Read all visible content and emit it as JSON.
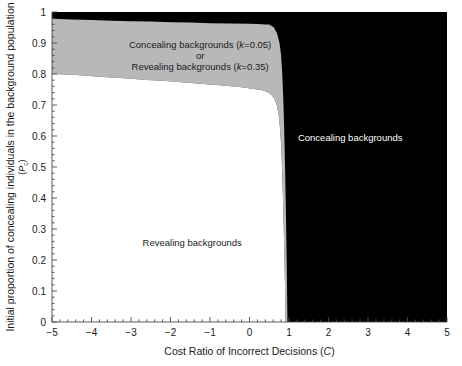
{
  "chart_data": {
    "type": "area",
    "title": "",
    "xlabel": "Cost Ratio of Incorrect Decisions (C)",
    "xlabel_main": "Cost Ratio of Incorrect Decisions (",
    "xlabel_var": "C",
    "xlabel_end": ")",
    "ylabel": "Initial proportion of concealing individuals in the background population",
    "ylabel_sub_open": "(",
    "ylabel_sub_var": "P",
    "ylabel_sub_idx": "c",
    "ylabel_sub_close": ")",
    "xlim": [
      -5,
      5
    ],
    "ylim": [
      0,
      1
    ],
    "xticks": [
      -5,
      -4,
      -3,
      -2,
      -1,
      0,
      1,
      2,
      3,
      4,
      5
    ],
    "xtick_labels": [
      "−5",
      "−4",
      "−3",
      "−2",
      "−1",
      "0",
      "1",
      "2",
      "3",
      "4",
      "5"
    ],
    "yticks": [
      0,
      0.1,
      0.2,
      0.3,
      0.4,
      0.5,
      0.6,
      0.7,
      0.8,
      0.9,
      1
    ],
    "ytick_labels": [
      "0",
      "0.1",
      "0.2",
      "0.3",
      "0.4",
      "0.5",
      "0.6",
      "0.7",
      "0.8",
      "0.9",
      "1"
    ],
    "minor_ticks_per_interval": 5,
    "grid": false,
    "legend_position": "none",
    "colors": {
      "region_concealing": "#000000",
      "region_mixed": "#b8b8b8",
      "region_revealing": "#ffffff",
      "axis": "#4a4a4a",
      "text_dark": "#1a1a1a",
      "text_light": "#ffffff"
    },
    "regions": [
      {
        "name": "concealing-backgrounds",
        "fill": "#000000",
        "label": "Concealing backgrounds",
        "label_x": 2.55,
        "label_y": 0.585,
        "label_color": "light"
      },
      {
        "name": "mixed-outcome",
        "fill": "#b8b8b8",
        "label_line1_main": "Concealing backgrounds (",
        "label_line1_var": "k",
        "label_line1_val": "=0.05)",
        "label_line2": "or",
        "label_line3_main": "Revealing backgrounds (",
        "label_line3_var": "k",
        "label_line3_val": "=0.35)",
        "label_x": -1.25,
        "label_y": 0.885,
        "label_color": "dark"
      },
      {
        "name": "revealing-backgrounds",
        "fill": "#ffffff",
        "label": "Revealing backgrounds",
        "label_x": -1.45,
        "label_y": 0.245,
        "label_color": "dark"
      }
    ],
    "boundary_black_gray": {
      "name": "upper-boundary-black-over-gray",
      "description": "Top black band lower edge: Pc decreasing slowly with C",
      "points": [
        [
          -5.0,
          0.978
        ],
        [
          -4.5,
          0.976
        ],
        [
          -4.0,
          0.974
        ],
        [
          -3.5,
          0.972
        ],
        [
          -3.0,
          0.97
        ],
        [
          -2.5,
          0.969
        ],
        [
          -2.0,
          0.967
        ],
        [
          -1.5,
          0.966
        ],
        [
          -1.0,
          0.964
        ],
        [
          -0.5,
          0.963
        ],
        [
          0.0,
          0.962
        ],
        [
          0.2,
          0.961
        ],
        [
          0.4,
          0.96
        ],
        [
          0.5,
          0.96
        ]
      ]
    },
    "boundary_gray_right": {
      "name": "gray-region-right-edge",
      "description": "Right edge of gray band curving down from top toward C=1 at low Pc",
      "points": [
        [
          0.5,
          0.96
        ],
        [
          0.62,
          0.95
        ],
        [
          0.7,
          0.93
        ],
        [
          0.76,
          0.9
        ],
        [
          0.8,
          0.86
        ],
        [
          0.83,
          0.8
        ],
        [
          0.855,
          0.72
        ],
        [
          0.875,
          0.64
        ],
        [
          0.89,
          0.56
        ],
        [
          0.905,
          0.47
        ],
        [
          0.918,
          0.38
        ],
        [
          0.93,
          0.29
        ],
        [
          0.941,
          0.2
        ],
        [
          0.95,
          0.11
        ],
        [
          0.958,
          0.03
        ],
        [
          0.96,
          0.0
        ]
      ]
    },
    "boundary_gray_white": {
      "name": "gray-white-boundary",
      "description": "Lower-left edge of gray band over white region, descending from 0.80 then turning down steeply near C=0.7",
      "points": [
        [
          -5.0,
          0.8
        ],
        [
          -4.6,
          0.798
        ],
        [
          -4.2,
          0.795
        ],
        [
          -3.8,
          0.791
        ],
        [
          -3.4,
          0.788
        ],
        [
          -3.0,
          0.785
        ],
        [
          -2.6,
          0.781
        ],
        [
          -2.2,
          0.778
        ],
        [
          -1.8,
          0.774
        ],
        [
          -1.4,
          0.77
        ],
        [
          -1.0,
          0.766
        ],
        [
          -0.6,
          0.762
        ],
        [
          -0.2,
          0.757
        ],
        [
          0.1,
          0.752
        ],
        [
          0.3,
          0.748
        ],
        [
          0.45,
          0.742
        ],
        [
          0.55,
          0.734
        ],
        [
          0.63,
          0.72
        ],
        [
          0.69,
          0.7
        ],
        [
          0.735,
          0.67
        ],
        [
          0.77,
          0.63
        ],
        [
          0.797,
          0.58
        ],
        [
          0.818,
          0.52
        ],
        [
          0.835,
          0.455
        ],
        [
          0.85,
          0.39
        ],
        [
          0.864,
          0.32
        ],
        [
          0.877,
          0.25
        ],
        [
          0.889,
          0.18
        ],
        [
          0.9,
          0.11
        ],
        [
          0.909,
          0.05
        ],
        [
          0.914,
          0.0
        ]
      ]
    }
  },
  "figure": {
    "plot_left": 52,
    "plot_top": 12,
    "plot_right": 447,
    "plot_bottom": 322
  }
}
